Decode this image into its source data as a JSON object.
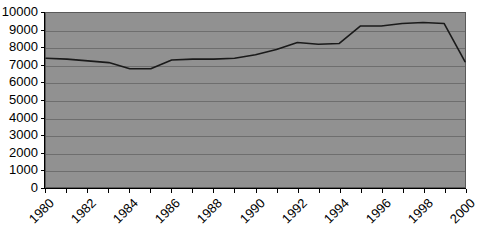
{
  "chart_data": {
    "type": "line",
    "title": "",
    "xlabel": "",
    "ylabel": "",
    "ylim": [
      0,
      10000
    ],
    "xlim": [
      1980,
      2000
    ],
    "grid": true,
    "legend": "none",
    "y_ticks": [
      10000,
      9000,
      8000,
      7000,
      6000,
      5000,
      4000,
      3000,
      2000,
      1000,
      0
    ],
    "x_tick_labels": [
      "1980",
      "1982",
      "1984",
      "1986",
      "1988",
      "1990",
      "1992",
      "1994",
      "1996",
      "1998",
      "2000"
    ],
    "x": [
      1980,
      1981,
      1982,
      1983,
      1984,
      1985,
      1986,
      1987,
      1988,
      1989,
      1990,
      1991,
      1992,
      1993,
      1994,
      1995,
      1996,
      1997,
      1998,
      1999,
      2000
    ],
    "values": [
      7400,
      7350,
      7250,
      7150,
      6800,
      6800,
      7300,
      7350,
      7350,
      7400,
      7600,
      7900,
      8300,
      8200,
      8250,
      9250,
      9250,
      9400,
      9450,
      9400,
      7200
    ],
    "series": [
      {
        "name": "series-1",
        "color": "#1a1a1a",
        "values": [
          7400,
          7350,
          7250,
          7150,
          6800,
          6800,
          7300,
          7350,
          7350,
          7400,
          7600,
          7900,
          8300,
          8200,
          8250,
          9250,
          9250,
          9400,
          9450,
          9400,
          7200
        ]
      }
    ],
    "colors": {
      "plot_background": "#919191",
      "gridline": "#6e6e6e",
      "axis": "#000000",
      "line": "#1a1a1a",
      "page_background": "#ffffff"
    }
  }
}
